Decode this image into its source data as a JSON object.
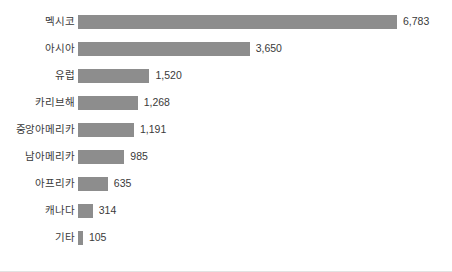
{
  "chart_data": {
    "type": "bar",
    "orientation": "horizontal",
    "title": "",
    "xlabel": "",
    "ylabel": "",
    "grid": false,
    "legend": false,
    "axis_visible": false,
    "xlim": [
      0,
      6783
    ],
    "bar_color": "#8d8d8d",
    "text_color": "#3a3a3a",
    "background": "#ffffff",
    "categories": [
      "멕시코",
      "아시아",
      "유럽",
      "카리브해",
      "중앙아메리카",
      "남아메리카",
      "아프리카",
      "캐나다",
      "기타"
    ],
    "values": [
      6783,
      3650,
      1520,
      1268,
      1191,
      985,
      635,
      314,
      105
    ],
    "value_labels": [
      "6,783",
      "3,650",
      "1,520",
      "1,268",
      "1,191",
      "985",
      "635",
      "314",
      "105"
    ]
  }
}
